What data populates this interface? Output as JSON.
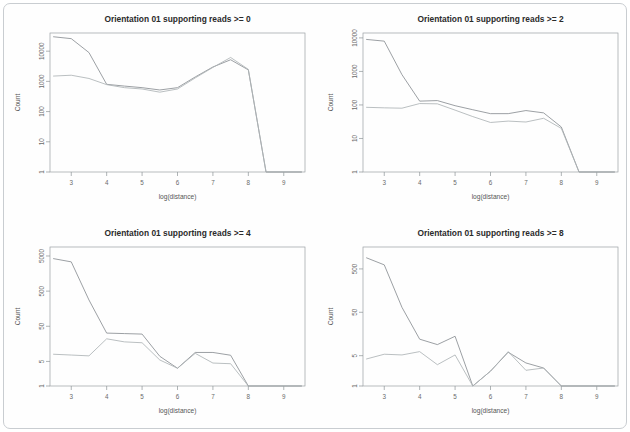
{
  "figure": {
    "panel_count": 4,
    "background_color": "#ffffff",
    "frame_color": "#c9cdd1"
  },
  "chart_data": [
    {
      "type": "line",
      "title": "Orientation 01 supporting reads >= 0",
      "xlabel": "log(distance)",
      "ylabel": "Count",
      "yscale": "log",
      "xlim": [
        2.4,
        9.6
      ],
      "ylim": [
        1,
        40000
      ],
      "xticks": [
        3,
        4,
        5,
        6,
        7,
        8,
        9
      ],
      "yticks": [
        1,
        10,
        100,
        1000,
        10000
      ],
      "ytick_labels": [
        "1",
        "10",
        "100",
        "1000",
        "10000"
      ],
      "grid": false,
      "legend": "none",
      "x": [
        2.5,
        3.0,
        3.5,
        4.0,
        4.5,
        5.0,
        5.5,
        6.0,
        6.5,
        7.0,
        7.5,
        8.0,
        8.5,
        9.0,
        9.5
      ],
      "series": [
        {
          "name": "series-1",
          "color": "#8a8f93",
          "values": [
            30000,
            26000,
            9000,
            800,
            700,
            620,
            520,
            620,
            1400,
            3000,
            5200,
            2400,
            1,
            1,
            1
          ]
        },
        {
          "name": "series-2",
          "color": "#aeb3b6",
          "values": [
            1500,
            1600,
            1250,
            780,
            620,
            560,
            440,
            560,
            1300,
            2900,
            6200,
            2500,
            1,
            1,
            1
          ]
        }
      ]
    },
    {
      "type": "line",
      "title": "Orientation 01 supporting reads >= 2",
      "xlabel": "log(distance)",
      "ylabel": "Count",
      "yscale": "log",
      "xlim": [
        2.4,
        9.6
      ],
      "ylim": [
        1,
        14000
      ],
      "xticks": [
        3,
        4,
        5,
        6,
        7,
        8,
        9
      ],
      "yticks": [
        1,
        10,
        100,
        1000,
        10000
      ],
      "ytick_labels": [
        "1",
        "10",
        "100",
        "1000",
        "10000"
      ],
      "grid": false,
      "legend": "none",
      "x": [
        2.5,
        3.0,
        3.5,
        4.0,
        4.5,
        5.0,
        5.5,
        6.0,
        6.5,
        7.0,
        7.5,
        8.0,
        8.5,
        9.0,
        9.5
      ],
      "series": [
        {
          "name": "series-1",
          "color": "#8a8f93",
          "values": [
            9000,
            8000,
            800,
            130,
            135,
            95,
            72,
            55,
            55,
            68,
            58,
            22,
            1,
            1,
            1
          ]
        },
        {
          "name": "series-2",
          "color": "#aeb3b6",
          "values": [
            85,
            82,
            80,
            110,
            108,
            70,
            45,
            30,
            33,
            31,
            40,
            20,
            1,
            1,
            1
          ]
        }
      ]
    },
    {
      "type": "line",
      "title": "Orientation 01 supporting reads >= 4",
      "xlabel": "log(distance)",
      "ylabel": "Count",
      "yscale": "log",
      "xlim": [
        2.4,
        9.6
      ],
      "ylim": [
        1,
        9000
      ],
      "xticks": [
        3,
        4,
        5,
        6,
        7,
        8,
        9
      ],
      "yticks": [
        1,
        5,
        50,
        500,
        5000
      ],
      "ytick_labels": [
        "1",
        "5",
        "50",
        "500",
        "5000"
      ],
      "grid": false,
      "legend": "none",
      "x": [
        2.5,
        3.0,
        3.5,
        4.0,
        4.5,
        5.0,
        5.5,
        6.0,
        6.5,
        7.0,
        7.5,
        8.0,
        8.5,
        9.0,
        9.5
      ],
      "series": [
        {
          "name": "series-1",
          "color": "#8a8f93",
          "values": [
            4200,
            3400,
            280,
            32,
            31,
            30,
            7,
            3.2,
            9,
            9,
            7.5,
            1,
            1,
            1,
            1
          ]
        },
        {
          "name": "series-2",
          "color": "#aeb3b6",
          "values": [
            8,
            7.6,
            7.2,
            22,
            18,
            17,
            5.5,
            3.2,
            8.5,
            4.5,
            4.3,
            1,
            1,
            1,
            1
          ]
        }
      ]
    },
    {
      "type": "line",
      "title": "Orientation 01 supporting reads >= 8",
      "xlabel": "log(distance)",
      "ylabel": "Count",
      "yscale": "log",
      "xlim": [
        2.4,
        9.6
      ],
      "ylim": [
        1,
        1600
      ],
      "xticks": [
        3,
        4,
        5,
        6,
        7,
        8,
        9
      ],
      "yticks": [
        1,
        5,
        50,
        500
      ],
      "ytick_labels": [
        "1",
        "5",
        "50",
        "500"
      ],
      "grid": false,
      "legend": "none",
      "x": [
        2.5,
        3.0,
        3.5,
        4.0,
        4.5,
        5.0,
        5.5,
        6.0,
        6.5,
        7.0,
        7.5,
        8.0,
        8.5,
        9.0,
        9.5
      ],
      "series": [
        {
          "name": "series-1",
          "color": "#8a8f93",
          "values": [
            900,
            620,
            65,
            12,
            9,
            14,
            1,
            2.2,
            6,
            3.4,
            2.6,
            1,
            1,
            1,
            1
          ]
        },
        {
          "name": "series-2",
          "color": "#aeb3b6",
          "values": [
            4.2,
            5.4,
            5.2,
            6.2,
            3.1,
            5.2,
            1,
            2.2,
            6.2,
            2.3,
            2.6,
            1,
            1,
            1,
            1
          ]
        }
      ]
    }
  ]
}
